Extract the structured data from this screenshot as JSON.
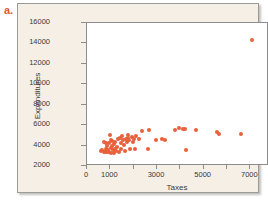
{
  "figure": {
    "part_label": "a.",
    "accent_color": "#e8603c",
    "panel_color": "#f6efe6"
  },
  "chart_data": {
    "type": "scatter",
    "title": "",
    "xlabel": "Taxes",
    "ylabel": "Expenditures",
    "xlim": [
      0,
      7800
    ],
    "ylim": [
      2000,
      16000
    ],
    "grid": false,
    "legend": null,
    "marker_color": "#e8603c",
    "xticks": [
      0,
      1000,
      2000,
      3000,
      4000,
      5000,
      6000,
      7000
    ],
    "xticklabels": [
      "0",
      "1000",
      "",
      "3000",
      "",
      "5000",
      "",
      "7000"
    ],
    "yticks": [
      2000,
      4000,
      6000,
      8000,
      10000,
      12000,
      14000,
      16000
    ],
    "yticklabels": [
      "2000",
      "4000",
      "6000",
      "8000",
      "10000",
      "12000",
      "14000",
      "16000"
    ],
    "points": [
      [
        660,
        3350
      ],
      [
        700,
        3500
      ],
      [
        760,
        3300
      ],
      [
        790,
        4300
      ],
      [
        820,
        3250
      ],
      [
        850,
        3600
      ],
      [
        860,
        4200
      ],
      [
        900,
        3300
      ],
      [
        920,
        3900
      ],
      [
        950,
        3450
      ],
      [
        980,
        4150
      ],
      [
        1000,
        3300
      ],
      [
        1030,
        4900
      ],
      [
        1050,
        3700
      ],
      [
        1060,
        4400
      ],
      [
        1080,
        3200
      ],
      [
        1100,
        3850
      ],
      [
        1120,
        4350
      ],
      [
        1150,
        3500
      ],
      [
        1180,
        3150
      ],
      [
        1200,
        4050
      ],
      [
        1230,
        3600
      ],
      [
        1260,
        4250
      ],
      [
        1300,
        3400
      ],
      [
        1340,
        3800
      ],
      [
        1380,
        4500
      ],
      [
        1400,
        3300
      ],
      [
        1450,
        4650
      ],
      [
        1480,
        4150
      ],
      [
        1520,
        3550
      ],
      [
        1560,
        4800
      ],
      [
        1600,
        4400
      ],
      [
        1620,
        4000
      ],
      [
        1650,
        3350
      ],
      [
        1700,
        4550
      ],
      [
        1740,
        4250
      ],
      [
        1780,
        4900
      ],
      [
        1800,
        4600
      ],
      [
        1850,
        4450
      ],
      [
        1900,
        3550
      ],
      [
        1950,
        4700
      ],
      [
        2000,
        4300
      ],
      [
        2050,
        4550
      ],
      [
        2100,
        3600
      ],
      [
        2150,
        4800
      ],
      [
        2250,
        4500
      ],
      [
        2400,
        5300
      ],
      [
        2650,
        3550
      ],
      [
        2700,
        5400
      ],
      [
        3000,
        4400
      ],
      [
        3250,
        4500
      ],
      [
        3400,
        4450
      ],
      [
        3800,
        5450
      ],
      [
        4000,
        5600
      ],
      [
        4150,
        5550
      ],
      [
        4250,
        5500
      ],
      [
        4300,
        3450
      ],
      [
        4700,
        5400
      ],
      [
        5600,
        5200
      ],
      [
        5700,
        5000
      ],
      [
        6650,
        5000
      ],
      [
        7100,
        14250
      ]
    ]
  }
}
